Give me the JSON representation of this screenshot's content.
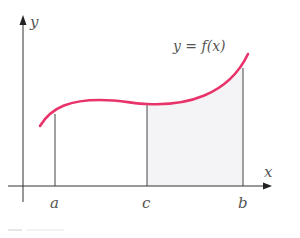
{
  "figure": {
    "axes": {
      "x_label": "x",
      "y_label": "y"
    },
    "function_label": "y = f(x)",
    "ticks": [
      {
        "name": "a",
        "label": "a"
      },
      {
        "name": "c",
        "label": "c"
      },
      {
        "name": "b",
        "label": "b"
      }
    ],
    "colors": {
      "curve": "#e8336b",
      "axes": "#333333",
      "shaded_region": "#f3f3f5",
      "text": "#555555"
    },
    "shaded_region": {
      "from": "c",
      "to": "b"
    }
  }
}
